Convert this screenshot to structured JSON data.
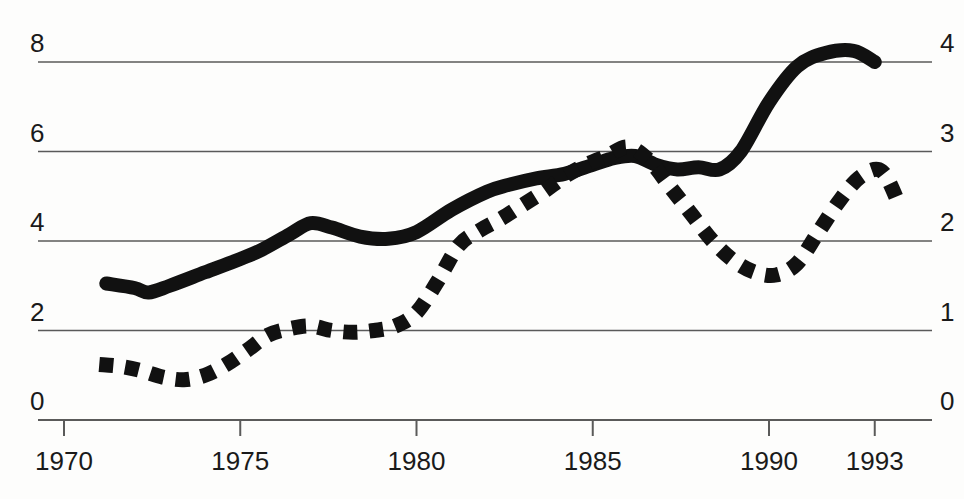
{
  "chart_data": {
    "type": "line",
    "title": "",
    "subtitle": "",
    "xlabel": "",
    "ylabel": "",
    "grid": true,
    "legend": "none",
    "xlim": [
      1970,
      1994
    ],
    "x_ticks": [
      "1970",
      "1975",
      "1980",
      "1985",
      "1990",
      "1993"
    ],
    "x_tick_values": [
      1970,
      1975,
      1980,
      1985,
      1990,
      1993
    ],
    "axes": {
      "left": {
        "ticks": [
          "0",
          "2",
          "4",
          "6",
          "8"
        ],
        "values": [
          0,
          2,
          4,
          6,
          8
        ],
        "ylim": [
          0,
          8
        ]
      },
      "right": {
        "ticks": [
          "0",
          "1",
          "2",
          "3",
          "4"
        ],
        "values": [
          0,
          1,
          2,
          3,
          4
        ],
        "ylim": [
          0,
          4
        ]
      }
    },
    "series": [
      {
        "name": "solid-line",
        "style": "solid",
        "axis": "left",
        "color": "#111111",
        "x": [
          1971.2,
          1972.0,
          1972.4,
          1973.0,
          1974.0,
          1975.0,
          1975.6,
          1976.4,
          1977.0,
          1977.6,
          1978.4,
          1979.2,
          1980.0,
          1981.0,
          1982.0,
          1982.6,
          1983.4,
          1984.2,
          1985.0,
          1985.6,
          1986.2,
          1986.8,
          1987.4,
          1988.0,
          1988.6,
          1989.2,
          1990.0,
          1990.8,
          1991.6,
          1992.4,
          1993.0
        ],
        "y": [
          3.05,
          2.95,
          2.85,
          3.0,
          3.3,
          3.6,
          3.8,
          4.15,
          4.4,
          4.3,
          4.1,
          4.05,
          4.2,
          4.7,
          5.1,
          5.25,
          5.4,
          5.5,
          5.7,
          5.85,
          5.9,
          5.7,
          5.6,
          5.65,
          5.6,
          6.0,
          7.1,
          7.9,
          8.2,
          8.25,
          8.0
        ]
      },
      {
        "name": "dotted-line",
        "style": "dotted",
        "axis": "right",
        "color": "#111111",
        "x": [
          1971.0,
          1971.6,
          1972.2,
          1972.8,
          1973.4,
          1974.0,
          1974.6,
          1975.2,
          1975.8,
          1976.4,
          1977.0,
          1977.6,
          1978.2,
          1978.8,
          1979.4,
          1980.0,
          1980.6,
          1981.2,
          1981.8,
          1982.4,
          1983.0,
          1983.6,
          1984.2,
          1984.8,
          1985.4,
          1986.0,
          1986.6,
          1987.2,
          1987.8,
          1988.4,
          1989.0,
          1989.6,
          1990.2,
          1990.8,
          1991.4,
          1992.0,
          1992.6,
          1993.2,
          1993.7
        ],
        "y": [
          0.62,
          0.6,
          0.55,
          0.48,
          0.45,
          0.5,
          0.62,
          0.78,
          0.95,
          1.02,
          1.05,
          1.0,
          0.98,
          1.0,
          1.05,
          1.2,
          1.55,
          1.95,
          2.12,
          2.25,
          2.4,
          2.55,
          2.72,
          2.85,
          2.95,
          3.05,
          2.9,
          2.6,
          2.3,
          2.0,
          1.78,
          1.65,
          1.62,
          1.75,
          2.1,
          2.45,
          2.72,
          2.78,
          2.4
        ]
      }
    ]
  },
  "geometry": {
    "plot_left": 64,
    "plot_right": 910,
    "plot_top": 62,
    "plot_bottom": 420
  }
}
